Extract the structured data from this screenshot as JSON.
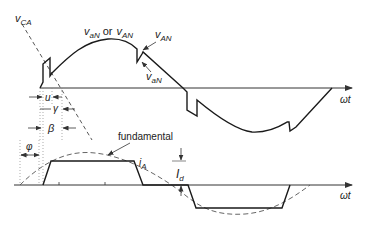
{
  "diagram": {
    "colors": {
      "line": "#1a1a1a",
      "axis": "#333333",
      "dashed": "#555555",
      "dotted": "#888888",
      "text": "#222222",
      "background": "#ffffff"
    },
    "labels": {
      "vca": {
        "main": "v",
        "sub": "CA"
      },
      "van_or_vAN": {
        "v1": "v",
        "sub1": "aN",
        "or": "or",
        "v2": "v",
        "sub2": "AN"
      },
      "vAN_right": {
        "main": "v",
        "sub": "AN"
      },
      "vaN_right": {
        "main": "v",
        "sub": "aN"
      },
      "u": "u",
      "gamma": "γ",
      "beta": "β",
      "phi": "φ",
      "fundamental": "fundamental",
      "iA": {
        "main": "i",
        "sub": "A"
      },
      "Id": {
        "main": "I",
        "sub": "d"
      },
      "omega_t_top": "ωt",
      "omega_t_bottom": "ωt"
    }
  }
}
